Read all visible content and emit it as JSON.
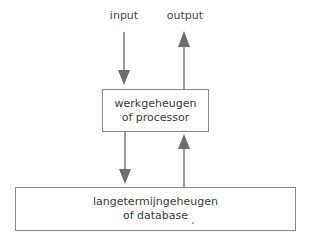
{
  "diagram": {
    "top_labels": {
      "input": "input",
      "output": "output"
    },
    "nodes": [
      {
        "id": "working-memory",
        "line1": "werkgeheugen",
        "line2": "of processor"
      },
      {
        "id": "long-term-memory",
        "line1": "langetermijngeheugen",
        "line2": "of database"
      }
    ],
    "edges": [
      {
        "from": "input",
        "to": "working-memory",
        "direction": "down"
      },
      {
        "from": "working-memory",
        "to": "output",
        "direction": "up"
      },
      {
        "from": "working-memory",
        "to": "long-term-memory",
        "direction": "down"
      },
      {
        "from": "long-term-memory",
        "to": "working-memory",
        "direction": "up"
      }
    ],
    "colors": {
      "arrow": "#6e6e6e",
      "box_border": "#8a8a8a",
      "text": "#3a3a3a"
    }
  }
}
